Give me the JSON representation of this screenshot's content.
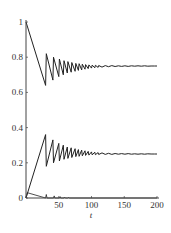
{
  "chart_data": {
    "type": "line",
    "title": "",
    "xlabel": "t",
    "ylabel": "",
    "xlim": [
      0,
      200
    ],
    "ylim": [
      0,
      1
    ],
    "grid": false,
    "legend": null,
    "x_ticks": [
      0,
      50,
      100,
      150,
      200
    ],
    "x_tick_labels": [
      "",
      "50",
      "100",
      "150",
      "200"
    ],
    "y_ticks": [
      0,
      0.2,
      0.4,
      0.6,
      0.8,
      1
    ],
    "y_tick_labels": [
      "0",
      "0.2",
      "0.4",
      "0.6",
      "0.8",
      "1"
    ],
    "series": [
      {
        "name": "upper",
        "color": "#222222",
        "x": [
          0,
          30,
          31,
          41,
          42,
          50,
          51,
          57,
          58,
          63,
          64,
          69,
          70,
          75,
          76,
          80,
          81,
          85,
          86,
          90,
          91,
          95,
          96,
          100,
          101,
          105,
          106,
          110,
          111,
          116,
          121,
          126,
          131,
          136,
          141,
          146,
          151,
          156,
          161,
          166,
          171,
          176,
          181,
          186,
          191,
          196,
          200
        ],
        "values": [
          1.0,
          0.64,
          0.82,
          0.67,
          0.8,
          0.69,
          0.79,
          0.7,
          0.78,
          0.71,
          0.775,
          0.715,
          0.77,
          0.72,
          0.765,
          0.725,
          0.763,
          0.728,
          0.76,
          0.732,
          0.758,
          0.735,
          0.756,
          0.738,
          0.755,
          0.74,
          0.754,
          0.742,
          0.753,
          0.744,
          0.752,
          0.746,
          0.752,
          0.747,
          0.751,
          0.748,
          0.751,
          0.748,
          0.751,
          0.749,
          0.751,
          0.749,
          0.751,
          0.749,
          0.75,
          0.75,
          0.75
        ]
      },
      {
        "name": "lower",
        "color": "#222222",
        "x": [
          0,
          30,
          31,
          41,
          42,
          50,
          51,
          57,
          58,
          63,
          64,
          69,
          70,
          75,
          76,
          80,
          81,
          85,
          86,
          90,
          91,
          95,
          96,
          100,
          101,
          105,
          106,
          110,
          111,
          116,
          121,
          126,
          131,
          136,
          141,
          146,
          151,
          156,
          161,
          166,
          171,
          176,
          181,
          186,
          191,
          196,
          200
        ],
        "values": [
          0.0,
          0.36,
          0.18,
          0.33,
          0.2,
          0.31,
          0.21,
          0.3,
          0.22,
          0.29,
          0.225,
          0.285,
          0.23,
          0.28,
          0.235,
          0.275,
          0.237,
          0.272,
          0.24,
          0.268,
          0.242,
          0.265,
          0.244,
          0.262,
          0.245,
          0.26,
          0.246,
          0.258,
          0.247,
          0.256,
          0.248,
          0.254,
          0.248,
          0.253,
          0.249,
          0.252,
          0.249,
          0.252,
          0.249,
          0.251,
          0.249,
          0.251,
          0.249,
          0.251,
          0.25,
          0.25,
          0.25
        ]
      },
      {
        "name": "spikes",
        "color": "#222222",
        "x": [
          0,
          2,
          30,
          31,
          32,
          42,
          43,
          44,
          51,
          52,
          53,
          58,
          59,
          60,
          64,
          65,
          66,
          200
        ],
        "values": [
          0.0,
          0.03,
          0.0,
          0.02,
          0.0,
          0.0,
          0.012,
          0.0,
          0.0,
          0.008,
          0.0,
          0.0,
          0.005,
          0.0,
          0.0,
          0.004,
          0.0,
          0.0
        ]
      }
    ]
  },
  "header": {
    "cut_off_text": "..."
  }
}
